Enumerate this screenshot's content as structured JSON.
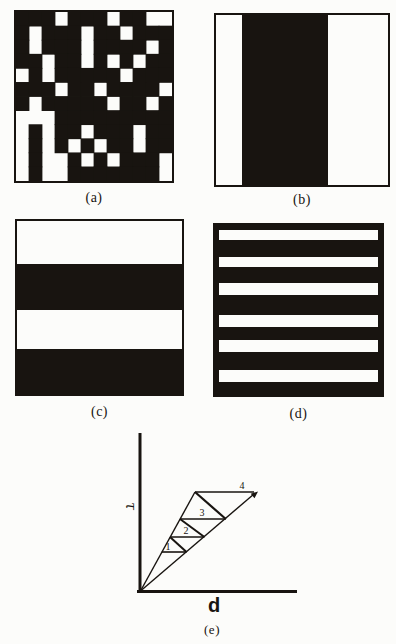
{
  "page": {
    "ink": "#181410",
    "paper": "#fcfcfa"
  },
  "panels": {
    "a": {
      "caption": "(a)",
      "type": "grid",
      "rows": 12,
      "cols": 12,
      "cells": [
        [
          1,
          1,
          1,
          0,
          1,
          1,
          1,
          0,
          1,
          1,
          0,
          0
        ],
        [
          1,
          0,
          1,
          1,
          1,
          0,
          1,
          1,
          0,
          1,
          1,
          1
        ],
        [
          1,
          0,
          1,
          1,
          1,
          0,
          1,
          1,
          1,
          1,
          0,
          1
        ],
        [
          1,
          1,
          0,
          1,
          1,
          0,
          1,
          0,
          1,
          0,
          1,
          1
        ],
        [
          0,
          1,
          0,
          1,
          1,
          1,
          1,
          1,
          0,
          1,
          1,
          1
        ],
        [
          1,
          1,
          1,
          0,
          1,
          1,
          0,
          1,
          1,
          1,
          1,
          0
        ],
        [
          1,
          0,
          1,
          1,
          1,
          1,
          1,
          0,
          1,
          1,
          0,
          1
        ],
        [
          0,
          0,
          0,
          1,
          1,
          1,
          1,
          1,
          1,
          1,
          1,
          1
        ],
        [
          0,
          1,
          0,
          1,
          1,
          0,
          1,
          1,
          1,
          0,
          1,
          1
        ],
        [
          0,
          1,
          0,
          1,
          0,
          1,
          0,
          1,
          1,
          0,
          1,
          1
        ],
        [
          0,
          1,
          0,
          0,
          1,
          0,
          1,
          0,
          1,
          1,
          1,
          0
        ],
        [
          0,
          1,
          0,
          0,
          1,
          1,
          1,
          1,
          1,
          1,
          1,
          0
        ]
      ]
    },
    "b": {
      "caption": "(b)",
      "type": "stripes-vertical",
      "stripes": [
        {
          "color": "white",
          "span": 0.151
        },
        {
          "color": "black",
          "span": 0.5
        },
        {
          "color": "white",
          "span": 0.349
        }
      ]
    },
    "c": {
      "caption": "(c)",
      "type": "stripes-horizontal",
      "stripes": [
        {
          "color": "white",
          "span": 0.249
        },
        {
          "color": "black",
          "span": 0.265
        },
        {
          "color": "white",
          "span": 0.226
        },
        {
          "color": "black",
          "span": 0.26
        }
      ]
    },
    "d": {
      "caption": "(d)",
      "type": "stripes-horizontal",
      "stripes": [
        {
          "color": "black",
          "span": 0.03
        },
        {
          "color": "white",
          "span": 0.058,
          "pad": 4
        },
        {
          "color": "black",
          "span": 0.098
        },
        {
          "color": "white",
          "span": 0.059,
          "pad": 4
        },
        {
          "color": "black",
          "span": 0.098
        },
        {
          "color": "white",
          "span": 0.069,
          "pad": 4
        },
        {
          "color": "black",
          "span": 0.117
        },
        {
          "color": "white",
          "span": 0.069,
          "pad": 4
        },
        {
          "color": "black",
          "span": 0.078
        },
        {
          "color": "white",
          "span": 0.069,
          "pad": 4
        },
        {
          "color": "black",
          "span": 0.108
        },
        {
          "color": "white",
          "span": 0.069,
          "pad": 4
        },
        {
          "color": "black",
          "span": 0.078
        }
      ]
    },
    "e": {
      "caption": "(e)"
    }
  },
  "chart_data": {
    "type": "diagram",
    "title": "",
    "xlabel": "d",
    "ylabel": "τ",
    "legend": [],
    "lines": [
      {
        "name": "y-axis",
        "x1": 140,
        "y1": 433,
        "x2": 140,
        "y2": 593,
        "w": 3
      },
      {
        "name": "x-axis",
        "x1": 137,
        "y1": 591.5,
        "x2": 297,
        "y2": 591.5,
        "w": 3
      },
      {
        "name": "ray-steep",
        "x1": 140.5,
        "y1": 591,
        "x2": 195,
        "y2": 492,
        "w": 1.4
      },
      {
        "name": "ray-shallow",
        "x1": 140.5,
        "y1": 591,
        "x2": 254,
        "y2": 494,
        "w": 1.4
      },
      {
        "name": "step-1",
        "x1": 161.7,
        "y1": 552,
        "x2": 186.5,
        "y2": 552,
        "w": 1.6
      },
      {
        "name": "step-2",
        "x1": 170,
        "y1": 537,
        "x2": 204.4,
        "y2": 537,
        "w": 1.6
      },
      {
        "name": "step-3",
        "x1": 180,
        "y1": 519,
        "x2": 225.8,
        "y2": 519,
        "w": 1.6
      },
      {
        "name": "step-4",
        "x1": 195,
        "y1": 492,
        "x2": 254,
        "y2": 492,
        "w": 1.6
      },
      {
        "name": "riser-1",
        "x1": 186.5,
        "y1": 552,
        "x2": 170,
        "y2": 537,
        "w": 2
      },
      {
        "name": "riser-2",
        "x1": 204.4,
        "y1": 537,
        "x2": 180,
        "y2": 519,
        "w": 2
      },
      {
        "name": "riser-3",
        "x1": 225.8,
        "y1": 519,
        "x2": 195,
        "y2": 492,
        "w": 2.2
      }
    ],
    "arrowhead": "258,491.5 254.5,498.3 250.7,493.7",
    "triangle_labels": [
      {
        "text": "1",
        "x": 168,
        "y": 550
      },
      {
        "text": "2",
        "x": 186,
        "y": 534
      },
      {
        "text": "3",
        "x": 202,
        "y": 516
      },
      {
        "text": "4",
        "x": 242,
        "y": 489
      }
    ],
    "y_label": {
      "text": "τ",
      "x": 130,
      "y": 506
    },
    "x_label": {
      "text": "d",
      "x": 214,
      "y": 612
    }
  }
}
